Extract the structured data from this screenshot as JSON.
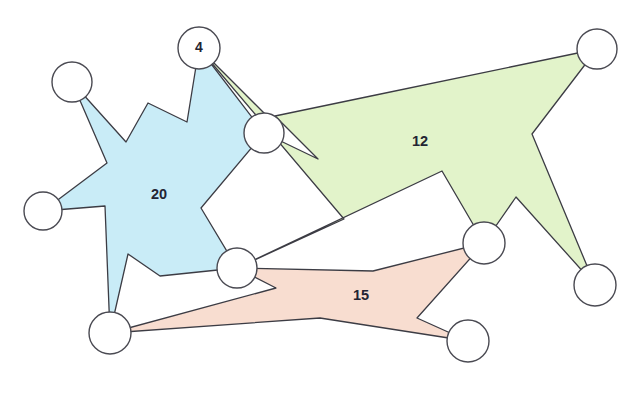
{
  "diagram": {
    "canvas": {
      "width": 640,
      "height": 394,
      "background": "#ffffff"
    },
    "regions": [
      {
        "id": "blue-region",
        "label": "20",
        "fill": "#c9ecf7",
        "stroke": "#3c3c44",
        "label_x": 159,
        "label_y": 195,
        "points": "199,48 187,122 148,103 126,142 72,82 107,163 43,211 105,206 110,333 128,254 160,276 237,268 201,208 264,133 199,48"
      },
      {
        "id": "green-region",
        "label": "12",
        "fill": "#e2f3ca",
        "stroke": "#3c3c44",
        "label_x": 420,
        "label_y": 142,
        "points": "199,48 270,119 264,133 318,159 275,116 371,96 597,49 532,134 595,285 516,197 484,243 442,171 237,268 344,219 199,48"
      },
      {
        "id": "pink-region",
        "label": "15",
        "fill": "#f8ddd0",
        "stroke": "#3c3c44",
        "label_x": 361,
        "label_y": 296,
        "points": "237,268 373,271 484,243 417,318 468,341 320,318 110,333 276,288 237,268"
      }
    ],
    "nodes": [
      {
        "id": "node-top-left",
        "cx": 72,
        "cy": 82,
        "r": 20,
        "label": ""
      },
      {
        "id": "node-four",
        "cx": 199,
        "cy": 48,
        "r": 21,
        "label": "4"
      },
      {
        "id": "node-top-right",
        "cx": 597,
        "cy": 49,
        "r": 20,
        "label": ""
      },
      {
        "id": "node-middle",
        "cx": 264,
        "cy": 133,
        "r": 20,
        "label": ""
      },
      {
        "id": "node-left",
        "cx": 43,
        "cy": 211,
        "r": 19,
        "label": ""
      },
      {
        "id": "node-right-middle",
        "cx": 484,
        "cy": 243,
        "r": 21,
        "label": ""
      },
      {
        "id": "node-center-bottom",
        "cx": 237,
        "cy": 268,
        "r": 20,
        "label": ""
      },
      {
        "id": "node-right-bottom",
        "cx": 595,
        "cy": 285,
        "r": 21,
        "label": ""
      },
      {
        "id": "node-bottom-left",
        "cx": 110,
        "cy": 333,
        "r": 21,
        "label": ""
      },
      {
        "id": "node-bottom-right",
        "cx": 468,
        "cy": 341,
        "r": 21,
        "label": ""
      }
    ]
  },
  "chart_data": {
    "type": "diagram",
    "node_count": 10,
    "region_count": 3,
    "region_labels": [
      "20",
      "4",
      "12",
      "15"
    ],
    "regions": [
      {
        "label": "20",
        "color": "#c9ecf7",
        "member_nodes": [
          "node-top-left",
          "node-four",
          "node-middle",
          "node-center-bottom",
          "node-bottom-left",
          "node-left"
        ]
      },
      {
        "label": "12",
        "color": "#e2f3ca",
        "member_nodes": [
          "node-four",
          "node-middle",
          "node-top-right",
          "node-right-bottom",
          "node-right-middle",
          "node-center-bottom"
        ]
      },
      {
        "label": "15",
        "color": "#f8ddd0",
        "member_nodes": [
          "node-center-bottom",
          "node-right-middle",
          "node-bottom-right",
          "node-bottom-left"
        ]
      }
    ],
    "node_labels": {
      "node-four": "4"
    }
  }
}
